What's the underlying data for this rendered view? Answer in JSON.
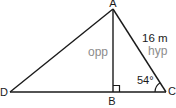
{
  "diagram": {
    "vertex_labels": {
      "a": "A",
      "b": "B",
      "c": "C",
      "d": "D"
    },
    "side_labels": {
      "opposite": "opp",
      "hypotenuse": "hyp",
      "hypotenuse_length": "16 m"
    },
    "angle_labels": {
      "angle_at_c": "54°"
    },
    "colors": {
      "line": "#1a1a1a",
      "text": "#1a1a1a",
      "muted_text": "#8c8c8c",
      "background": "#ffffff"
    }
  }
}
